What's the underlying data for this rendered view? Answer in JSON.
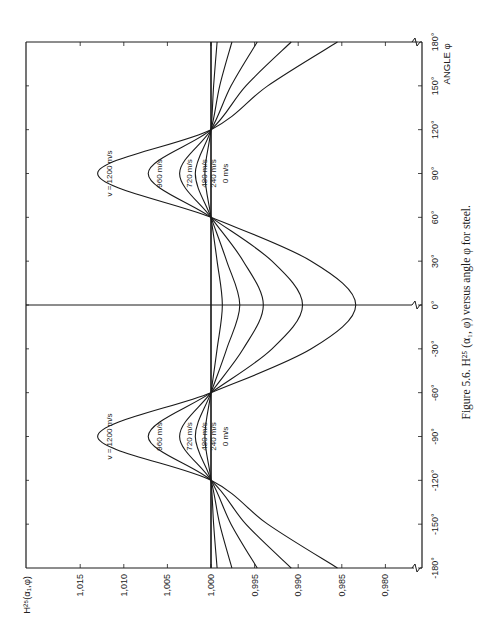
{
  "figure": {
    "caption": "Figure 5.6.  H²⁵ (α₁, φ) versus angle φ for steel.",
    "y_axis_title": "H²⁵(α₁,φ)",
    "x_axis_title": "ANGLE φ"
  },
  "chart_data": {
    "type": "line",
    "title": "H²⁵ (α₁, φ) versus angle φ for steel",
    "xlabel": "ANGLE φ",
    "ylabel": "H²⁵(α₁,φ)",
    "xlim": [
      -180,
      180
    ],
    "ylim": [
      0.98,
      1.015
    ],
    "x_ticks": [
      "-180°",
      "-150°",
      "-120°",
      "-90°",
      "-60°",
      "-30°",
      "0°",
      "30°",
      "60°",
      "90°",
      "120°",
      "150°",
      "180°"
    ],
    "y_ticks": [
      "1,015",
      "1,010",
      "1,005",
      "1,000",
      "0,995",
      "0,990",
      "0,985",
      "0,980"
    ],
    "grid": false,
    "legend_position": "inline curve labels",
    "orientation_note": "figure printed rotated 90°",
    "x": [
      -180,
      -150,
      -120,
      -90,
      -60,
      -30,
      0,
      30,
      60,
      90,
      120,
      150,
      180
    ],
    "series": [
      {
        "name": "v = 1200 m/s",
        "values": [
          0.9855,
          0.9935,
          1.0,
          1.013,
          1.0,
          0.9885,
          0.9834,
          0.9885,
          1.0,
          1.013,
          1.0,
          0.9935,
          0.9855
        ]
      },
      {
        "name": "960 m/s",
        "values": [
          0.9908,
          0.996,
          1.0,
          1.0072,
          1.0,
          0.993,
          0.9895,
          0.993,
          1.0,
          1.0072,
          1.0,
          0.996,
          0.9908
        ]
      },
      {
        "name": "720 m/s",
        "values": [
          0.9947,
          0.9977,
          1.0,
          1.0036,
          1.0,
          0.9963,
          0.994,
          0.9963,
          1.0,
          1.0036,
          1.0,
          0.9977,
          0.9947
        ]
      },
      {
        "name": "480 m/s",
        "values": [
          0.9976,
          0.999,
          1.0,
          1.0018,
          1.0,
          0.9982,
          0.9967,
          0.9982,
          1.0,
          1.0018,
          1.0,
          0.999,
          0.9976
        ]
      },
      {
        "name": "240 m/s",
        "values": [
          0.9993,
          0.9997,
          1.0,
          1.0007,
          1.0,
          0.9993,
          0.9987,
          0.9993,
          1.0,
          1.0007,
          1.0,
          0.9997,
          0.9993
        ]
      },
      {
        "name": "0 m/s",
        "values": [
          1.0,
          1.0,
          1.0,
          1.0,
          1.0,
          1.0,
          1.0,
          1.0,
          1.0,
          1.0,
          1.0,
          1.0,
          1.0
        ]
      }
    ],
    "node_angles": [
      -120,
      -45,
      50,
      120
    ],
    "curve_labels": [
      "v = 1200 m/s",
      "960 m/s",
      "720 m/s",
      "480 m/s",
      "240 m/s",
      "0 m/s"
    ]
  },
  "style": {
    "ink": "#1a1a1a",
    "paper": "#ffffff"
  }
}
